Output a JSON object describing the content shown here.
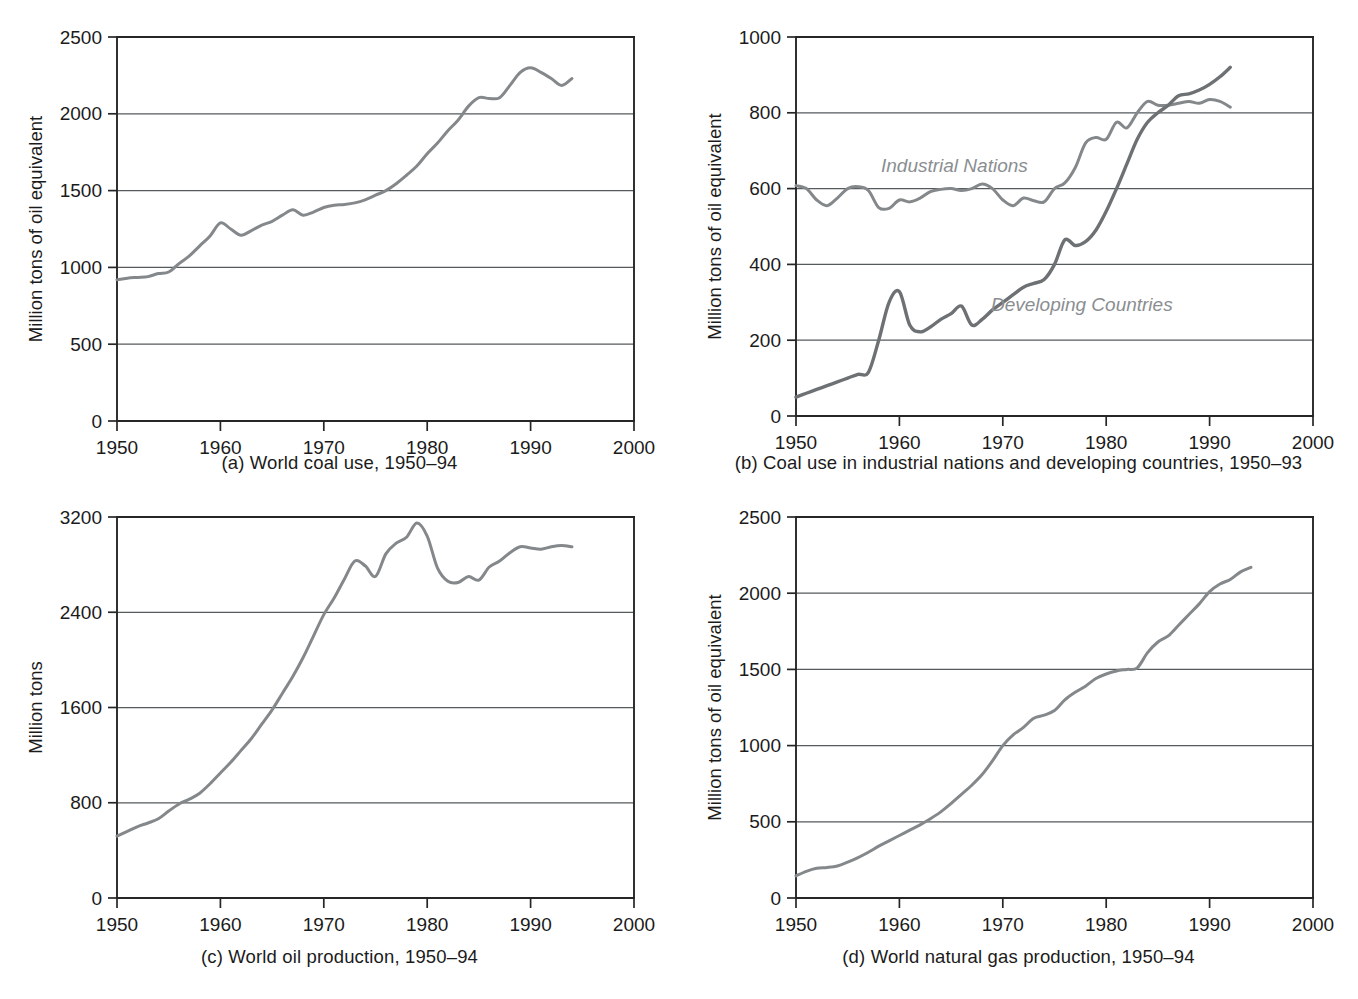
{
  "figure": {
    "panel_count": 4,
    "axis_color": "#262626",
    "grid_color": "#555a5c",
    "line_color": "#84888b",
    "label_color": "#8a8e91"
  },
  "panels": [
    {
      "id": "a",
      "caption": "(a) World coal use, 1950–94",
      "ylabel": "Million tons of oil equivalent",
      "yticks": [
        "0",
        "500",
        "1000",
        "1500",
        "2000",
        "2500"
      ],
      "xticks": [
        "1950",
        "1960",
        "1970",
        "1980",
        "1990",
        "2000"
      ]
    },
    {
      "id": "b",
      "caption": "(b) Coal use in industrial nations and developing countries, 1950–93",
      "ylabel": "Million tons of oil equivalent",
      "yticks": [
        "0",
        "200",
        "400",
        "600",
        "800",
        "1000"
      ],
      "xticks": [
        "1950",
        "1960",
        "1970",
        "1980",
        "1990",
        "2000"
      ],
      "series_labels": [
        {
          "name": "industrial-nations",
          "text": "Industrial Nations"
        },
        {
          "name": "developing-countries",
          "text": "Developing Countries"
        }
      ]
    },
    {
      "id": "c",
      "caption": "(c) World oil production, 1950–94",
      "ylabel": "Million tons",
      "yticks": [
        "0",
        "800",
        "1600",
        "2400",
        "3200"
      ],
      "xticks": [
        "1950",
        "1960",
        "1970",
        "1980",
        "1990",
        "2000"
      ]
    },
    {
      "id": "d",
      "caption": "(d) World natural gas production, 1950–94",
      "ylabel": "Million tons of oil equivalent",
      "yticks": [
        "0",
        "500",
        "1000",
        "1500",
        "2000",
        "2500"
      ],
      "xticks": [
        "1950",
        "1960",
        "1970",
        "1980",
        "1990",
        "2000"
      ]
    }
  ],
  "chart_data": [
    {
      "panel": "a",
      "type": "line",
      "title": "(a) World coal use, 1950–94",
      "xlabel": "",
      "ylabel": "Million tons of oil equivalent",
      "xlim": [
        1950,
        2000
      ],
      "ylim": [
        0,
        2500
      ],
      "yticks": [
        0,
        500,
        1000,
        1500,
        2000,
        2500
      ],
      "xticks": [
        1950,
        1960,
        1970,
        1980,
        1990,
        2000
      ],
      "grid": "horizontal",
      "legend": "none",
      "series": [
        {
          "name": "World coal use",
          "x": [
            1950,
            1951,
            1952,
            1953,
            1954,
            1955,
            1956,
            1957,
            1958,
            1959,
            1960,
            1961,
            1962,
            1963,
            1964,
            1965,
            1966,
            1967,
            1968,
            1969,
            1970,
            1971,
            1972,
            1973,
            1974,
            1975,
            1976,
            1977,
            1978,
            1979,
            1980,
            1981,
            1982,
            1983,
            1984,
            1985,
            1986,
            1987,
            1988,
            1989,
            1990,
            1991,
            1992,
            1993,
            1994
          ],
          "values": [
            920,
            930,
            935,
            940,
            960,
            970,
            1025,
            1075,
            1140,
            1205,
            1290,
            1250,
            1210,
            1240,
            1275,
            1300,
            1340,
            1375,
            1340,
            1360,
            1390,
            1405,
            1410,
            1420,
            1440,
            1470,
            1500,
            1545,
            1600,
            1660,
            1740,
            1810,
            1890,
            1960,
            2050,
            2105,
            2100,
            2105,
            2185,
            2270,
            2300,
            2270,
            2230,
            2185,
            2230,
            2240
          ]
        }
      ]
    },
    {
      "panel": "b",
      "type": "line",
      "title": "(b) Coal use in industrial nations and developing countries, 1950–93",
      "xlabel": "",
      "ylabel": "Million tons of oil equivalent",
      "xlim": [
        1950,
        2000
      ],
      "ylim": [
        0,
        1000
      ],
      "yticks": [
        0,
        200,
        400,
        600,
        800,
        1000
      ],
      "xticks": [
        1950,
        1960,
        1970,
        1980,
        1990,
        2000
      ],
      "grid": "horizontal",
      "legend": "inline-annotations",
      "series": [
        {
          "name": "Industrial Nations",
          "x": [
            1950,
            1951,
            1952,
            1953,
            1954,
            1955,
            1956,
            1957,
            1958,
            1959,
            1960,
            1961,
            1962,
            1963,
            1964,
            1965,
            1966,
            1967,
            1968,
            1969,
            1970,
            1971,
            1972,
            1973,
            1974,
            1975,
            1976,
            1977,
            1978,
            1979,
            1980,
            1981,
            1982,
            1983,
            1984,
            1985,
            1986,
            1987,
            1988,
            1989,
            1990,
            1991,
            1992
          ],
          "values": [
            608,
            600,
            570,
            555,
            575,
            600,
            605,
            595,
            550,
            548,
            570,
            565,
            575,
            592,
            598,
            600,
            595,
            600,
            612,
            600,
            570,
            555,
            575,
            568,
            565,
            600,
            615,
            655,
            720,
            735,
            730,
            775,
            760,
            800,
            830,
            820,
            820,
            825,
            830,
            825,
            835,
            830,
            815
          ]
        },
        {
          "name": "Developing Countries",
          "x": [
            1950,
            1951,
            1952,
            1953,
            1954,
            1955,
            1956,
            1957,
            1958,
            1959,
            1960,
            1961,
            1962,
            1963,
            1964,
            1965,
            1966,
            1967,
            1968,
            1969,
            1970,
            1971,
            1972,
            1973,
            1974,
            1975,
            1976,
            1977,
            1978,
            1979,
            1980,
            1981,
            1982,
            1983,
            1984,
            1985,
            1986,
            1987,
            1988,
            1989,
            1990,
            1991,
            1992
          ],
          "values": [
            50,
            60,
            70,
            80,
            90,
            100,
            110,
            115,
            200,
            300,
            328,
            240,
            222,
            235,
            255,
            270,
            290,
            240,
            255,
            280,
            300,
            320,
            340,
            350,
            360,
            400,
            465,
            450,
            460,
            490,
            540,
            600,
            665,
            730,
            775,
            800,
            820,
            845,
            850,
            860,
            875,
            895,
            920
          ]
        }
      ]
    },
    {
      "panel": "c",
      "type": "line",
      "title": "(c) World oil production, 1950–94",
      "xlabel": "",
      "ylabel": "Million tons",
      "xlim": [
        1950,
        2000
      ],
      "ylim": [
        0,
        3200
      ],
      "yticks": [
        0,
        800,
        1600,
        2400,
        3200
      ],
      "xticks": [
        1950,
        1960,
        1970,
        1980,
        1990,
        2000
      ],
      "grid": "horizontal",
      "legend": "none",
      "series": [
        {
          "name": "World oil production",
          "x": [
            1950,
            1951,
            1952,
            1953,
            1954,
            1955,
            1956,
            1957,
            1958,
            1959,
            1960,
            1961,
            1962,
            1963,
            1964,
            1965,
            1966,
            1967,
            1968,
            1969,
            1970,
            1971,
            1972,
            1973,
            1974,
            1975,
            1976,
            1977,
            1978,
            1979,
            1980,
            1981,
            1982,
            1983,
            1984,
            1985,
            1986,
            1987,
            1988,
            1989,
            1990,
            1991,
            1992,
            1993,
            1994
          ],
          "values": [
            520,
            560,
            600,
            630,
            665,
            730,
            790,
            830,
            880,
            960,
            1050,
            1140,
            1240,
            1340,
            1460,
            1580,
            1720,
            1860,
            2020,
            2200,
            2380,
            2520,
            2680,
            2830,
            2790,
            2700,
            2890,
            2980,
            3030,
            3150,
            3040,
            2770,
            2660,
            2650,
            2700,
            2670,
            2780,
            2830,
            2900,
            2950,
            2940,
            2930,
            2950,
            2960,
            2950
          ]
        }
      ]
    },
    {
      "panel": "d",
      "type": "line",
      "title": "(d) World natural gas production, 1950–94",
      "xlabel": "",
      "ylabel": "Million tons of oil equivalent",
      "xlim": [
        1950,
        2000
      ],
      "ylim": [
        0,
        2500
      ],
      "yticks": [
        0,
        500,
        1000,
        1500,
        2000,
        2500
      ],
      "xticks": [
        1950,
        1960,
        1970,
        1980,
        1990,
        2000
      ],
      "grid": "horizontal",
      "legend": "none",
      "series": [
        {
          "name": "World natural gas production",
          "x": [
            1950,
            1951,
            1952,
            1953,
            1954,
            1955,
            1956,
            1957,
            1958,
            1959,
            1960,
            1961,
            1962,
            1963,
            1964,
            1965,
            1966,
            1967,
            1968,
            1969,
            1970,
            1971,
            1972,
            1973,
            1974,
            1975,
            1976,
            1977,
            1978,
            1979,
            1980,
            1981,
            1982,
            1983,
            1984,
            1985,
            1986,
            1987,
            1988,
            1989,
            1990,
            1991,
            1992,
            1993,
            1994
          ],
          "values": [
            145,
            175,
            195,
            200,
            210,
            235,
            265,
            300,
            340,
            375,
            410,
            445,
            480,
            520,
            565,
            620,
            680,
            740,
            810,
            900,
            1000,
            1070,
            1120,
            1180,
            1200,
            1230,
            1300,
            1350,
            1390,
            1440,
            1470,
            1490,
            1500,
            1510,
            1610,
            1680,
            1720,
            1790,
            1860,
            1930,
            2010,
            2060,
            2090,
            2140,
            2170
          ]
        }
      ]
    }
  ],
  "page_footer": ""
}
